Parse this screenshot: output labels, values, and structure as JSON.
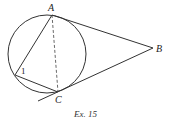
{
  "diagram": {
    "points": {
      "A": {
        "label": "A",
        "x": 52,
        "y": 16
      },
      "B": {
        "label": "B",
        "x": 153,
        "y": 48
      },
      "C": {
        "label": "C",
        "x": 58,
        "y": 92
      },
      "D": {
        "label": "",
        "x": 15,
        "y": 75
      }
    },
    "circle": {
      "cx": 47,
      "cy": 54,
      "r": 39
    },
    "angle_label": "1",
    "segments": [
      {
        "from": "A",
        "to": "B",
        "style": "solid",
        "note": "tangent at A"
      },
      {
        "from": "C",
        "to": "B",
        "style": "solid",
        "note": "tangent at C, extended past C"
      },
      {
        "from": "A",
        "to": "D",
        "style": "solid"
      },
      {
        "from": "D",
        "to": "C",
        "style": "solid"
      },
      {
        "from": "A",
        "to": "C",
        "style": "dashed"
      }
    ],
    "caption": "Ex. 15"
  }
}
